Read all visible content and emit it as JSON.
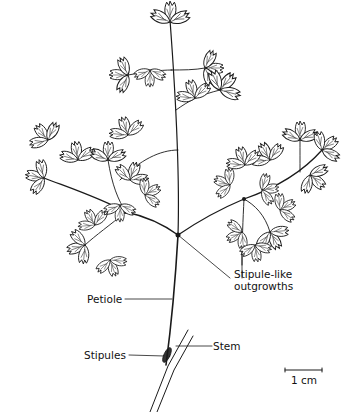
{
  "figure": {
    "labels": {
      "stipule_like": [
        "Stipule-like",
        "outgrowths"
      ],
      "petiole": "Petiole",
      "stem": "Stem",
      "stipules": "Stipules"
    },
    "scale_bar": {
      "label": "1 cm"
    },
    "colors": {
      "ink": "#1a1a1a",
      "background": "#ffffff"
    }
  }
}
